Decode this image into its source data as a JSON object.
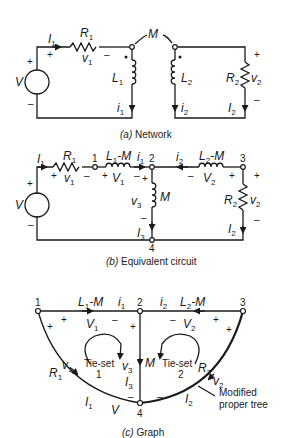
{
  "figure": {
    "panels": [
      {
        "id": "a",
        "caption": "(a) Network",
        "caption_letter": "(a)",
        "caption_text": "Network",
        "elements": {
          "source": "V",
          "R1": {
            "label": "R",
            "sub": "1"
          },
          "v1": {
            "label": "v",
            "sub": "1"
          },
          "I1": {
            "label": "I",
            "sub": "1"
          },
          "L1": {
            "label": "L",
            "sub": "1"
          },
          "i1": {
            "label": "i",
            "sub": "1"
          },
          "M": "M",
          "L2": {
            "label": "L",
            "sub": "2"
          },
          "i2": {
            "label": "i",
            "sub": "2"
          },
          "R2": {
            "label": "R",
            "sub": "2"
          },
          "v2": {
            "label": "v",
            "sub": "2"
          },
          "I2": {
            "label": "I",
            "sub": "2"
          }
        },
        "polarity": {
          "plus": "+",
          "minus": "–"
        }
      },
      {
        "id": "b",
        "caption": "(b) Equivalent circuit",
        "caption_letter": "(b)",
        "caption_text": "Equivalent circuit",
        "nodes": [
          "1",
          "2",
          "3",
          "4"
        ],
        "elements": {
          "source": "V",
          "R1": {
            "label": "R",
            "sub": "1"
          },
          "v1": {
            "label": "v",
            "sub": "1"
          },
          "I1": {
            "label": "I",
            "sub": "1"
          },
          "L1M": {
            "label": "L",
            "sub": "1",
            "suffix": "-M"
          },
          "V1": {
            "label": "V",
            "sub": "1"
          },
          "i1": {
            "label": "i",
            "sub": "1"
          },
          "i2": {
            "label": "i",
            "sub": "2"
          },
          "L2M": {
            "label": "L",
            "sub": "2",
            "suffix": "-M"
          },
          "V2": {
            "label": "V",
            "sub": "2"
          },
          "M": "M",
          "v3": {
            "label": "v",
            "sub": "3"
          },
          "I3": {
            "label": "I",
            "sub": "3"
          },
          "R2": {
            "label": "R",
            "sub": "2"
          },
          "v2": {
            "label": "v",
            "sub": "2"
          },
          "I2": {
            "label": "I",
            "sub": "2"
          }
        }
      },
      {
        "id": "c",
        "caption": "(c) Graph",
        "caption_letter": "(c)",
        "caption_text": "Graph",
        "nodes": [
          "1",
          "2",
          "3",
          "4"
        ],
        "tie_sets": [
          {
            "label": "Tie-set",
            "num": "1"
          },
          {
            "label": "Tie-set",
            "num": "2"
          }
        ],
        "annotation": {
          "line1": "Modified",
          "line2": "proper tree"
        },
        "elements": {
          "L1M": {
            "label": "L",
            "sub": "1",
            "suffix": "-M"
          },
          "i1": {
            "label": "i",
            "sub": "1"
          },
          "i2": {
            "label": "i",
            "sub": "2"
          },
          "L2M": {
            "label": "L",
            "sub": "2",
            "suffix": "-M"
          },
          "V1": {
            "label": "V",
            "sub": "1"
          },
          "V2": {
            "label": "V",
            "sub": "2"
          },
          "v1": {
            "label": "v",
            "sub": "1"
          },
          "R1": {
            "label": "R",
            "sub": "1"
          },
          "I1": {
            "label": "I",
            "sub": "1"
          },
          "V": "V",
          "v3": {
            "label": "v",
            "sub": "3"
          },
          "M": "M",
          "I3": {
            "label": "I",
            "sub": "3"
          },
          "R2": {
            "label": "R",
            "sub": "2"
          },
          "v2": {
            "label": "v",
            "sub": "2"
          },
          "I2": {
            "label": "I",
            "sub": "2"
          }
        }
      }
    ]
  }
}
